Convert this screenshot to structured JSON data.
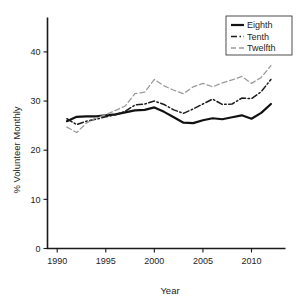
{
  "chart_data": {
    "type": "line",
    "title": "",
    "xlabel": "Year",
    "ylabel": "% Volunteer Monthly",
    "xlim": [
      1989,
      2013.5
    ],
    "ylim": [
      0,
      47
    ],
    "xticks": [
      1990,
      1995,
      2000,
      2005,
      2010
    ],
    "yticks": [
      0,
      10,
      20,
      30,
      40
    ],
    "grid": false,
    "legend_position": "top-right",
    "x": [
      1991,
      1992,
      1993,
      1994,
      1995,
      1996,
      1997,
      1998,
      1999,
      2000,
      2001,
      2002,
      2003,
      2004,
      2005,
      2006,
      2007,
      2008,
      2009,
      2010,
      2011,
      2012
    ],
    "series": [
      {
        "name": "Eighth",
        "style": "solid",
        "color": "#111111",
        "width": 2.2,
        "values": [
          25.9,
          26.8,
          26.9,
          26.9,
          27.1,
          27.3,
          27.7,
          28.1,
          28.2,
          28.7,
          27.8,
          26.7,
          25.6,
          25.5,
          26.1,
          26.5,
          26.3,
          26.7,
          27.1,
          26.4,
          27.6,
          29.4
        ]
      },
      {
        "name": "Tenth",
        "style": "dashdot",
        "color": "#1c1c1c",
        "width": 1.5,
        "values": [
          26.4,
          25.2,
          25.9,
          26.3,
          26.8,
          27.2,
          27.9,
          29.2,
          29.4,
          30.0,
          29.3,
          28.2,
          27.5,
          28.4,
          29.4,
          30.4,
          29.3,
          29.4,
          30.6,
          30.5,
          31.9,
          34.4
        ]
      },
      {
        "name": "Twelfth",
        "style": "dashed",
        "color": "#9a9a9a",
        "width": 1.3,
        "values": [
          24.7,
          23.6,
          25.5,
          26.6,
          27.2,
          28.1,
          29.0,
          31.5,
          31.8,
          34.4,
          33.1,
          32.2,
          31.5,
          32.9,
          33.6,
          32.9,
          33.7,
          34.3,
          35.0,
          33.6,
          34.8,
          37.2
        ]
      }
    ]
  },
  "legend": {
    "items": [
      {
        "label": "Eighth"
      },
      {
        "label": "Tenth"
      },
      {
        "label": "Twelfth"
      }
    ]
  }
}
